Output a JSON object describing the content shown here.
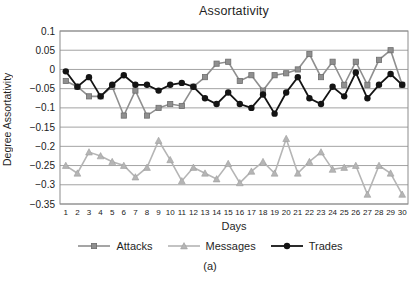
{
  "figure": {
    "title": "Assortativity",
    "xlabel": "Days",
    "ylabel": "Degree Assortativity",
    "caption": "(a)"
  },
  "chart_data": {
    "type": "line",
    "title": "Assortativity",
    "xlabel": "Days",
    "ylabel": "Degree Assortativity",
    "x": [
      1,
      2,
      3,
      4,
      5,
      6,
      7,
      8,
      9,
      10,
      11,
      12,
      13,
      14,
      15,
      16,
      17,
      18,
      19,
      20,
      21,
      22,
      23,
      24,
      25,
      26,
      27,
      28,
      29,
      30
    ],
    "ylim": [
      -0.35,
      0.1
    ],
    "ytick_labels": [
      "0.1",
      "0.05",
      "0",
      "−0.05",
      "−0.1",
      "−0.15",
      "−0.2",
      "−0.25",
      "−0.3",
      "−0.35"
    ],
    "ytick_values": [
      0.1,
      0.05,
      0,
      -0.05,
      -0.1,
      -0.15,
      -0.2,
      -0.25,
      -0.3,
      -0.35
    ],
    "grid": true,
    "legend_position": "bottom",
    "colors": {
      "grid": "#a3a3a3",
      "border": "#8c8c8c",
      "tick_text": "#1a1a1a"
    },
    "series": [
      {
        "name": "Attacks",
        "marker": "square",
        "color": "#8f8f8f",
        "marker_edge": "#6e6e6e",
        "values": [
          -0.03,
          -0.045,
          -0.07,
          -0.07,
          -0.045,
          -0.12,
          -0.055,
          -0.12,
          -0.1,
          -0.09,
          -0.095,
          -0.045,
          -0.02,
          0.015,
          0.02,
          -0.03,
          -0.015,
          -0.055,
          -0.015,
          -0.01,
          0.0,
          0.04,
          -0.02,
          0.02,
          -0.04,
          0.02,
          -0.04,
          0.025,
          0.05,
          -0.04
        ]
      },
      {
        "name": "Messages",
        "marker": "triangle",
        "color": "#b5b5b5",
        "marker_edge": "#9e9e9e",
        "values": [
          -0.25,
          -0.27,
          -0.215,
          -0.225,
          -0.24,
          -0.25,
          -0.28,
          -0.255,
          -0.185,
          -0.235,
          -0.29,
          -0.255,
          -0.27,
          -0.285,
          -0.245,
          -0.295,
          -0.265,
          -0.24,
          -0.27,
          -0.18,
          -0.27,
          -0.24,
          -0.215,
          -0.26,
          -0.255,
          -0.25,
          -0.325,
          -0.25,
          -0.27,
          -0.325
        ]
      },
      {
        "name": "Trades",
        "marker": "circle",
        "color": "#141414",
        "marker_edge": "#141414",
        "values": [
          -0.005,
          -0.045,
          -0.02,
          -0.07,
          -0.04,
          -0.015,
          -0.04,
          -0.04,
          -0.055,
          -0.04,
          -0.035,
          -0.045,
          -0.075,
          -0.09,
          -0.06,
          -0.09,
          -0.1,
          -0.065,
          -0.115,
          -0.06,
          -0.02,
          -0.075,
          -0.09,
          -0.045,
          -0.07,
          -0.008,
          -0.075,
          -0.04,
          -0.012,
          -0.04
        ]
      }
    ]
  }
}
